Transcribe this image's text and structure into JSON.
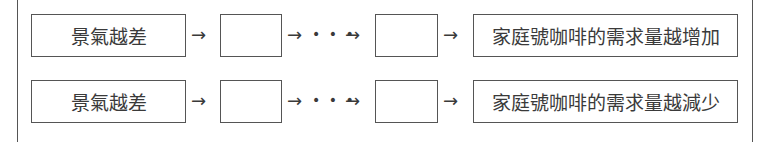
{
  "diagram": {
    "rows": [
      {
        "start": "景氣越差",
        "arrow": "→",
        "ellipsis": "⋯",
        "blank_boxes": [
          "",
          ""
        ],
        "end": "家庭號咖啡的需求量越增加"
      },
      {
        "start": "景氣越差",
        "arrow": "→",
        "ellipsis": "⋯",
        "blank_boxes": [
          "",
          ""
        ],
        "end": "家庭號咖啡的需求量越減少"
      }
    ]
  }
}
